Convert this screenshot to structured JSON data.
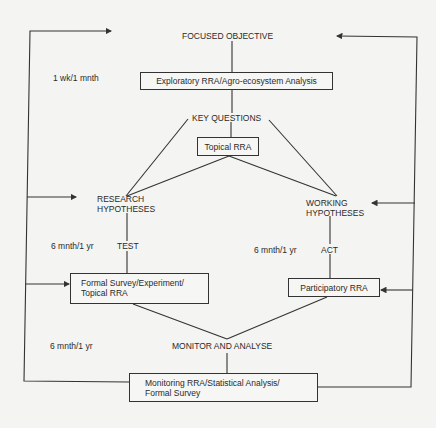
{
  "title": "FOCUSED OBJECTIVE",
  "nodes": {
    "exploratory": "Exploratory RRA/Agro-ecosystem Analysis",
    "key_questions": "KEY QUESTIONS",
    "topical": "Topical RRA",
    "research_1": "RESEARCH",
    "research_2": "HYPOTHESES",
    "working_1": "WORKING",
    "working_2": "HYPOTHESES",
    "test": "TEST",
    "act": "ACT",
    "formal_1": "Formal Survey/Experiment/",
    "formal_2": "Topical RRA",
    "participatory": "Participatory RRA",
    "monitor": "MONITOR AND ANALYSE",
    "monitoring_1": "Monitoring RRA/Statistical Analysis/",
    "monitoring_2": "Formal Survey"
  },
  "durations": {
    "exploratory": "1 wk/1 mnth",
    "test": "6 mnth/1 yr",
    "act": "6 mnth/1 yr",
    "monitor": "6 mnth/1 yr"
  },
  "colors": {
    "line": "#333333",
    "background": "#f4f4f2"
  }
}
